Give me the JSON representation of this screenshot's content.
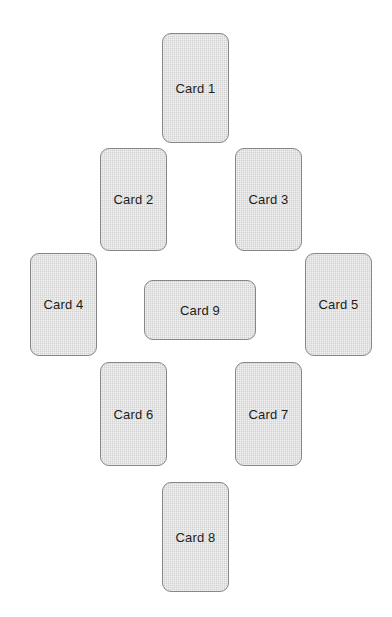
{
  "canvas": {
    "width": 392,
    "height": 617,
    "background_color": "#ffffff"
  },
  "style": {
    "card_fill": "#d2d2d2",
    "card_border": "#878787",
    "label_color": "#1c1c1c",
    "corner_radius": 9
  },
  "layout": {
    "name": "nine-card-diamond",
    "description": "Nine rounded rectangles arranged in a diamond/cross pattern with one landscape card at center"
  },
  "cards": [
    {
      "label": "Card 1",
      "x": 162,
      "y": 33,
      "width": 67,
      "height": 110,
      "orientation": "portrait"
    },
    {
      "label": "Card 2",
      "x": 100,
      "y": 148,
      "width": 67,
      "height": 103,
      "orientation": "portrait"
    },
    {
      "label": "Card 3",
      "x": 235,
      "y": 148,
      "width": 67,
      "height": 103,
      "orientation": "portrait"
    },
    {
      "label": "Card 4",
      "x": 30,
      "y": 253,
      "width": 67,
      "height": 103,
      "orientation": "portrait"
    },
    {
      "label": "Card 9",
      "x": 144,
      "y": 280,
      "width": 112,
      "height": 60,
      "orientation": "landscape"
    },
    {
      "label": "Card 5",
      "x": 305,
      "y": 253,
      "width": 67,
      "height": 103,
      "orientation": "portrait"
    },
    {
      "label": "Card 6",
      "x": 100,
      "y": 362,
      "width": 67,
      "height": 104,
      "orientation": "portrait"
    },
    {
      "label": "Card 7",
      "x": 235,
      "y": 362,
      "width": 67,
      "height": 104,
      "orientation": "portrait"
    },
    {
      "label": "Card 8",
      "x": 162,
      "y": 482,
      "width": 67,
      "height": 110,
      "orientation": "portrait"
    }
  ]
}
